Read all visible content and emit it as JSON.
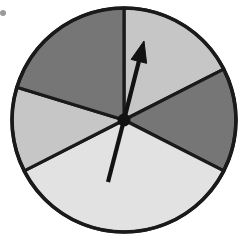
{
  "figure": {
    "name": "spinner-wheel",
    "background_color": "#ffffff",
    "outline_color": "#1a1a1a"
  },
  "chart_data": {
    "type": "pie",
    "subtitle": "",
    "xlabel": "",
    "ylabel": "",
    "legend_position": "none",
    "grid": false,
    "center": {
      "x": 124,
      "y": 120
    },
    "radius": 112,
    "start_angle_deg": 90,
    "direction": "counterclockwise",
    "categories": [
      "top-left",
      "left",
      "bottom",
      "right",
      "top-right"
    ],
    "values": [
      73,
      44,
      126,
      54,
      63
    ],
    "labels": [
      "",
      "",
      "",
      "",
      ""
    ],
    "slices": [
      {
        "name": "top-left",
        "start_angle_deg": 90,
        "end_angle_deg": 163,
        "sweep_deg": 73,
        "color": "#767676",
        "shade": "dark-grey"
      },
      {
        "name": "left",
        "start_angle_deg": 163,
        "end_angle_deg": 207,
        "sweep_deg": 44,
        "color": "#c6c6c6",
        "shade": "light-grey"
      },
      {
        "name": "bottom",
        "start_angle_deg": 207,
        "end_angle_deg": 333,
        "sweep_deg": 126,
        "color": "#e2e2e2",
        "shade": "near-white"
      },
      {
        "name": "right",
        "start_angle_deg": 333,
        "end_angle_deg": 387,
        "sweep_deg": 54,
        "color": "#767676",
        "shade": "dark-grey"
      },
      {
        "name": "top-right",
        "start_angle_deg": 27,
        "end_angle_deg": 90,
        "sweep_deg": 63,
        "color": "#c6c6c6",
        "shade": "light-grey"
      }
    ],
    "colors": [
      "#767676",
      "#c6c6c6",
      "#e2e2e2",
      "#767676",
      "#c6c6c6"
    ]
  },
  "pointer": {
    "name": "spinner-needle",
    "color": "#121212",
    "tip": {
      "x": 144,
      "y": 41
    },
    "tail": {
      "x": 108,
      "y": 182
    },
    "pivot": {
      "x": 124,
      "y": 120
    },
    "heading_deg": 75,
    "has_arrowhead": true,
    "points_to_slice": "top-right"
  },
  "marks": {
    "corner_speck": {
      "x": 3,
      "y": 13,
      "radius": 3,
      "color": "#9a9a9a"
    }
  }
}
